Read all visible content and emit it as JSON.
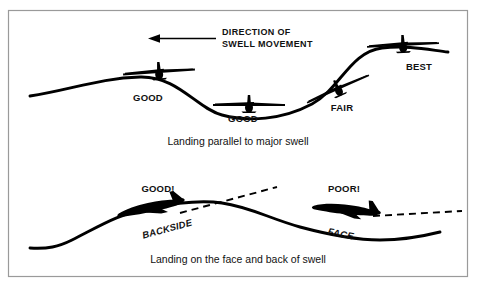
{
  "figure": {
    "title_upper_caption": "Landing parallel to major swell",
    "title_lower_caption": "Landing on the face and back of swell",
    "direction_note": {
      "line1": "DIRECTION OF",
      "line2": "SWELL MOVEMENT",
      "arrow_icon": "arrow-left-icon"
    },
    "upper_diagram": {
      "name": "Landing parallel to major swell",
      "ratings": [
        {
          "label": "GOOD",
          "position": "upwind-crest-backside",
          "x": 148,
          "y": 101
        },
        {
          "label": "GOOD",
          "position": "trough",
          "x": 243,
          "y": 122
        },
        {
          "label": "FAIR",
          "position": "rising-face",
          "x": 342,
          "y": 111
        },
        {
          "label": "BEST",
          "position": "crest",
          "x": 419,
          "y": 70
        }
      ],
      "aircraft_view": "top-view",
      "aircraft_count": 4
    },
    "lower_diagram": {
      "name": "Landing on the face and back of swell",
      "ratings": [
        {
          "label": "GOOD!",
          "x": 158,
          "y": 192
        },
        {
          "label": "POOR!",
          "x": 344,
          "y": 192
        }
      ],
      "slope_labels": [
        {
          "label": "BACKSIDE",
          "x": 168,
          "y": 232
        },
        {
          "label": "FACE",
          "x": 340,
          "y": 237
        }
      ],
      "aircraft_view": "side-view",
      "aircraft_count": 2,
      "flight_path_style": "dashed"
    },
    "colors": {
      "ink": "#000000",
      "frame": "#9a9a9a",
      "background": "#ffffff"
    }
  }
}
